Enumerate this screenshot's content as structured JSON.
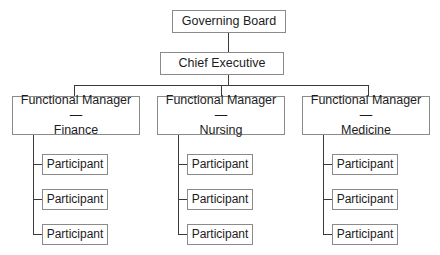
{
  "chart": {
    "type": "org-chart",
    "background_color": "#ffffff",
    "box_fill_color": "#ffffff",
    "box_border_color": "#8a8a8a",
    "connector_color": "#3a3a3a",
    "text_color": "#1c1c1c"
  },
  "nodes": {
    "governing_board": {
      "label": "Governing Board",
      "level": 1
    },
    "chief_executive": {
      "label": "Chief Executive",
      "level": 2
    },
    "managers": [
      {
        "label_line1": "Functional Manager—",
        "label_line2": "Finance",
        "level": 3,
        "participants": [
          {
            "label": "Participant"
          },
          {
            "label": "Participant"
          },
          {
            "label": "Participant"
          }
        ]
      },
      {
        "label_line1": "Functional Manager—",
        "label_line2": "Nursing",
        "level": 3,
        "participants": [
          {
            "label": "Participant"
          },
          {
            "label": "Participant"
          },
          {
            "label": "Participant"
          }
        ]
      },
      {
        "label_line1": "Functional Manager—",
        "label_line2": "Medicine",
        "level": 3,
        "participants": [
          {
            "label": "Participant"
          },
          {
            "label": "Participant"
          },
          {
            "label": "Participant"
          }
        ]
      }
    ]
  }
}
